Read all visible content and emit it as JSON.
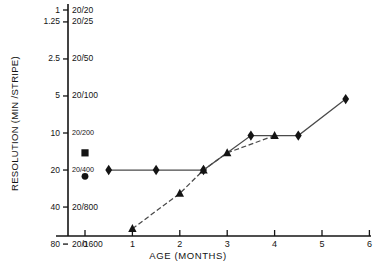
{
  "chart_data": {
    "type": "line",
    "title": "",
    "xlabel": "AGE  (MONTHS)",
    "ylabel": "RESOLUTION (MIN /STRIPE)",
    "xlim": [
      -0.75,
      6.35
    ],
    "ylim_log_minutes": [
      0.9,
      95
    ],
    "y_scale": "log-inverted",
    "grid": false,
    "legend": "none",
    "x_ticks": [
      0,
      1,
      2,
      3,
      4,
      5,
      6
    ],
    "x_tick_labels": [
      "0",
      "1",
      "2",
      "3",
      "4",
      "5",
      "6"
    ],
    "y_ticks_minutes": [
      1,
      1.25,
      2.5,
      5,
      10,
      20,
      40,
      80
    ],
    "y_tick_labels_minutes": [
      "1",
      "1.25",
      "2.5",
      "5",
      "10",
      "20",
      "40",
      "80"
    ],
    "y_tick_labels_snellen": [
      "20/20",
      "20/25",
      "20/50",
      "20/100",
      "20/200",
      "20/400",
      "20/800",
      "20/1600"
    ],
    "series": [
      {
        "name": "diamond-series",
        "marker": "diamond",
        "line": "solid",
        "points": [
          {
            "x": 0.5,
            "y": 20
          },
          {
            "x": 1.5,
            "y": 20
          },
          {
            "x": 2.5,
            "y": 20
          },
          {
            "x": 3.5,
            "y": 10.5
          },
          {
            "x": 4.5,
            "y": 10.5
          },
          {
            "x": 5.5,
            "y": 5.3
          }
        ]
      },
      {
        "name": "triangle-series",
        "marker": "triangle",
        "line": "dashed",
        "points": [
          {
            "x": 1.0,
            "y": 60
          },
          {
            "x": 2.0,
            "y": 31
          },
          {
            "x": 2.5,
            "y": 20
          },
          {
            "x": 3.0,
            "y": 14.5
          },
          {
            "x": 4.0,
            "y": 10.5
          }
        ]
      },
      {
        "name": "newborn-square-point",
        "marker": "square",
        "line": "none",
        "points": [
          {
            "x": 0.0,
            "y": 14.5
          }
        ]
      },
      {
        "name": "newborn-circle-point",
        "marker": "circle",
        "line": "none",
        "points": [
          {
            "x": 0.0,
            "y": 22.5
          }
        ]
      }
    ]
  },
  "axes": {
    "y_axis_label": "RESOLUTION (MIN /STRIPE)",
    "x_axis_label": "AGE  (MONTHS)"
  },
  "colors": {
    "ink": "#141414",
    "background": "#ffffff",
    "line": "#555555"
  }
}
